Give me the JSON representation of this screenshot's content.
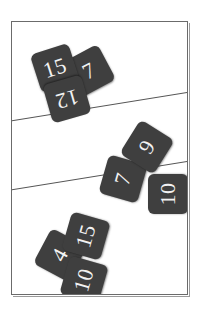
{
  "scene": {
    "title": "Scattered number cards on a lined panel",
    "background_color": "#ffffff",
    "panel": {
      "name": "framed-panel",
      "border_color": "#6b6b6b",
      "fill_color": "#ffffff"
    },
    "dividers": [
      {
        "name": "divider-upper",
        "color": "#555555"
      },
      {
        "name": "divider-lower",
        "color": "#555555"
      }
    ],
    "card_style": {
      "fill_color": "#3f3f3f",
      "text_color": "#f2f2f2"
    }
  },
  "groups": [
    {
      "name": "top-band",
      "cards": [
        {
          "value": "15"
        },
        {
          "value": "7"
        },
        {
          "value": "12"
        }
      ]
    },
    {
      "name": "middle-band",
      "cards": [
        {
          "value": "9"
        },
        {
          "value": "7"
        },
        {
          "value": "10"
        }
      ]
    },
    {
      "name": "bottom-band",
      "cards": [
        {
          "value": "15"
        },
        {
          "value": "4"
        },
        {
          "value": "10"
        }
      ]
    }
  ]
}
